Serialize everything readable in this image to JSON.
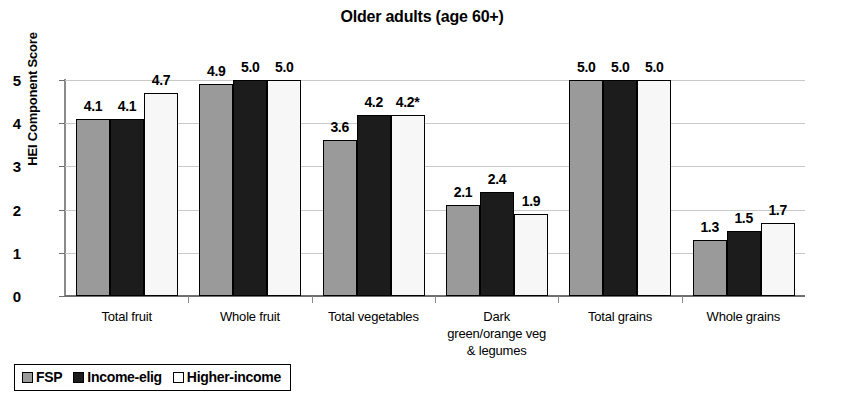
{
  "chart_data": {
    "type": "bar",
    "title": "Older adults (age 60+)",
    "xlabel": "",
    "ylabel": "HEI Component Score",
    "ylim": [
      0,
      5
    ],
    "yticks": [
      "0",
      "1",
      "2",
      "3",
      "4",
      "5"
    ],
    "grid": true,
    "legend_position": "bottom-left",
    "categories": [
      "Total fruit",
      "Whole fruit",
      "Total vegetables",
      "Dark green/orange veg & legumes",
      "Total grains",
      "Whole grains"
    ],
    "category_lines": [
      [
        "Total fruit"
      ],
      [
        "Whole fruit"
      ],
      [
        "Total vegetables"
      ],
      [
        "Dark",
        "green/orange veg",
        "& legumes"
      ],
      [
        "Total grains"
      ],
      [
        "Whole grains"
      ]
    ],
    "series": [
      {
        "name": "FSP",
        "color": "#9a9a9a",
        "values": [
          4.1,
          4.9,
          3.6,
          2.1,
          5.0,
          1.3
        ],
        "labels": [
          "4.1",
          "4.9",
          "3.6",
          "2.1",
          "5.0",
          "1.3"
        ]
      },
      {
        "name": "Income-elig",
        "color": "#1c1c1c",
        "values": [
          4.1,
          5.0,
          4.2,
          2.4,
          5.0,
          1.5
        ],
        "labels": [
          "4.1",
          "5.0",
          "4.2",
          "2.4",
          "5.0",
          "1.5"
        ]
      },
      {
        "name": "Higher-income",
        "color": "#f7f7f7",
        "values": [
          4.7,
          5.0,
          4.2,
          1.9,
          5.0,
          1.7
        ],
        "labels": [
          "4.7",
          "5.0",
          "4.2*",
          "1.9",
          "5.0",
          "1.7"
        ]
      }
    ]
  },
  "title": {
    "text": "Older adults (age 60+)"
  },
  "y_axis": {
    "title": "HEI Component Score",
    "ticks": [
      "5",
      "4",
      "3",
      "2",
      "1",
      "0"
    ]
  },
  "x_axis": {
    "labels": [
      {
        "line1": "Total fruit",
        "line2": "",
        "line3": ""
      },
      {
        "line1": "Whole fruit",
        "line2": "",
        "line3": ""
      },
      {
        "line1": "Total vegetables",
        "line2": "",
        "line3": ""
      },
      {
        "line1": "Dark",
        "line2": "green/orange veg",
        "line3": "& legumes"
      },
      {
        "line1": "Total grains",
        "line2": "",
        "line3": ""
      },
      {
        "line1": "Whole grains",
        "line2": "",
        "line3": ""
      }
    ]
  },
  "legend": {
    "items": [
      {
        "label": "FSP",
        "swatch": "gray"
      },
      {
        "label": "Income-elig",
        "swatch": "black"
      },
      {
        "label": "Higher-income",
        "swatch": "white"
      }
    ]
  },
  "values": {
    "g0s0": "4.1",
    "g0s1": "4.1",
    "g0s2": "4.7",
    "g1s0": "4.9",
    "g1s1": "5.0",
    "g1s2": "5.0",
    "g2s0": "3.6",
    "g2s1": "4.2",
    "g2s2": "4.2*",
    "g3s0": "2.1",
    "g3s1": "2.4",
    "g3s2": "1.9",
    "g4s0": "5.0",
    "g4s1": "5.0",
    "g4s2": "5.0",
    "g5s0": "1.3",
    "g5s1": "1.5",
    "g5s2": "1.7"
  },
  "colors": {
    "fsp": "#9a9a9a",
    "income_elig": "#1c1c1c",
    "higher_income": "#f7f7f7",
    "axis": "#6f6f6f",
    "grid": "#c9c9c9"
  }
}
